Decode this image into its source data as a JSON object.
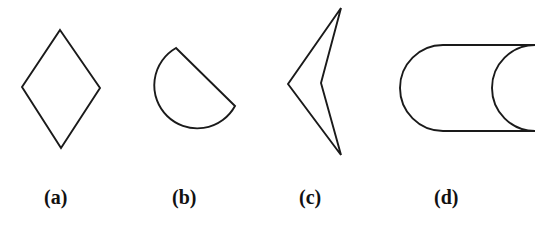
{
  "figure": {
    "background_color": "#ffffff",
    "stroke_color": "#1a1a1a",
    "stroke_width": 1.9,
    "width": 546,
    "height": 235,
    "panels": [
      {
        "id": "a",
        "caption": "(a)",
        "shape_name": "rhombus",
        "shape_kind": "polygon",
        "vertices": [
          [
            60,
            30
          ],
          [
            100,
            88
          ],
          [
            61,
            148
          ],
          [
            22,
            87
          ]
        ],
        "closed": true,
        "bbox": [
          22,
          30,
          78,
          118
        ]
      },
      {
        "id": "b",
        "caption": "(b)",
        "shape_name": "circular-sector-with-corner",
        "shape_kind": "arc-polygon",
        "path": "M 176 48 L 235 106 A 43 43 0 1 1 176 48 Z",
        "corner_points": [
          [
            176,
            48
          ],
          [
            235,
            106
          ]
        ],
        "arc_center": [
          192,
          91
        ],
        "arc_radius": 43,
        "bbox": [
          152,
          48,
          83,
          85
        ]
      },
      {
        "id": "c",
        "caption": "(c)",
        "shape_name": "concave-dart-arrowhead",
        "shape_kind": "polygon",
        "vertices": [
          [
            341,
            8
          ],
          [
            321,
            83
          ],
          [
            341,
            155
          ],
          [
            288,
            84
          ]
        ],
        "closed": true,
        "bbox": [
          288,
          8,
          53,
          147
        ]
      },
      {
        "id": "d",
        "caption": "(d)",
        "shape_name": "crescent-rounded-left-concave-right",
        "shape_kind": "arc-polygon",
        "path": "M 535 45 L 443 45 A 43 43 0 0 0 443 131 L 535 131 A 43 43 0 0 1 535 45 Z",
        "left_cap_center": [
          443,
          88
        ],
        "left_cap_radius": 43,
        "right_arc_center": [
          505,
          88
        ],
        "right_arc_radius": 43,
        "bbox": [
          400,
          45,
          135,
          86
        ]
      }
    ]
  }
}
